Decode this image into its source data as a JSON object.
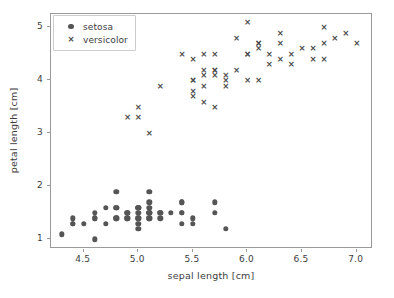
{
  "chart_data": {
    "type": "scatter",
    "title": "",
    "xlabel": "sepal length [cm]",
    "ylabel": "petal length [cm]",
    "xlim": [
      4.2,
      7.15
    ],
    "ylim": [
      0.82,
      5.25
    ],
    "xticks": [
      "4.5",
      "5.0",
      "5.5",
      "6.0",
      "6.5",
      "7.0"
    ],
    "xtick_values": [
      4.5,
      5.0,
      5.5,
      6.0,
      6.5,
      7.0
    ],
    "yticks": [
      "1",
      "2",
      "3",
      "4",
      "5"
    ],
    "ytick_values": [
      1,
      2,
      3,
      4,
      5
    ],
    "grid": false,
    "legend_position": "upper left",
    "marker_color": "#555555",
    "series": [
      {
        "name": "setosa",
        "marker": "circle",
        "color": "#555555",
        "points": [
          [
            5.1,
            1.4
          ],
          [
            4.9,
            1.4
          ],
          [
            4.7,
            1.3
          ],
          [
            4.6,
            1.5
          ],
          [
            5.0,
            1.4
          ],
          [
            5.4,
            1.7
          ],
          [
            4.6,
            1.4
          ],
          [
            5.0,
            1.5
          ],
          [
            4.4,
            1.4
          ],
          [
            4.9,
            1.5
          ],
          [
            5.4,
            1.5
          ],
          [
            4.8,
            1.6
          ],
          [
            4.8,
            1.4
          ],
          [
            4.3,
            1.1
          ],
          [
            5.8,
            1.2
          ],
          [
            5.7,
            1.5
          ],
          [
            5.4,
            1.3
          ],
          [
            5.1,
            1.4
          ],
          [
            5.7,
            1.7
          ],
          [
            5.1,
            1.5
          ],
          [
            5.4,
            1.7
          ],
          [
            5.1,
            1.5
          ],
          [
            4.6,
            1.0
          ],
          [
            5.1,
            1.7
          ],
          [
            4.8,
            1.9
          ],
          [
            5.0,
            1.6
          ],
          [
            5.0,
            1.6
          ],
          [
            5.2,
            1.5
          ],
          [
            5.2,
            1.4
          ],
          [
            4.7,
            1.6
          ],
          [
            4.8,
            1.6
          ],
          [
            5.4,
            1.5
          ],
          [
            5.2,
            1.5
          ],
          [
            5.5,
            1.4
          ],
          [
            4.9,
            1.5
          ],
          [
            5.0,
            1.2
          ],
          [
            5.5,
            1.3
          ],
          [
            4.9,
            1.4
          ],
          [
            4.4,
            1.3
          ],
          [
            5.1,
            1.5
          ],
          [
            5.0,
            1.3
          ],
          [
            4.5,
            1.3
          ],
          [
            4.4,
            1.3
          ],
          [
            5.0,
            1.6
          ],
          [
            5.1,
            1.9
          ],
          [
            4.8,
            1.4
          ],
          [
            5.1,
            1.6
          ],
          [
            4.6,
            1.4
          ],
          [
            5.3,
            1.5
          ],
          [
            5.0,
            1.4
          ]
        ]
      },
      {
        "name": "versicolor",
        "marker": "x",
        "color": "#4a4a4a",
        "points": [
          [
            7.0,
            4.7
          ],
          [
            6.4,
            4.5
          ],
          [
            6.9,
            4.9
          ],
          [
            5.5,
            4.0
          ],
          [
            6.5,
            4.6
          ],
          [
            5.7,
            4.5
          ],
          [
            6.3,
            4.7
          ],
          [
            4.9,
            3.3
          ],
          [
            6.6,
            4.6
          ],
          [
            5.2,
            3.9
          ],
          [
            5.0,
            3.5
          ],
          [
            5.9,
            4.2
          ],
          [
            6.0,
            4.0
          ],
          [
            6.1,
            4.7
          ],
          [
            5.6,
            3.6
          ],
          [
            6.7,
            4.4
          ],
          [
            5.6,
            4.5
          ],
          [
            5.8,
            4.1
          ],
          [
            6.2,
            4.5
          ],
          [
            5.6,
            3.9
          ],
          [
            5.9,
            4.8
          ],
          [
            6.1,
            4.0
          ],
          [
            6.3,
            4.9
          ],
          [
            6.1,
            4.7
          ],
          [
            6.4,
            4.3
          ],
          [
            6.6,
            4.4
          ],
          [
            6.8,
            4.8
          ],
          [
            6.7,
            5.0
          ],
          [
            6.0,
            4.5
          ],
          [
            5.7,
            3.5
          ],
          [
            5.5,
            3.8
          ],
          [
            5.5,
            3.7
          ],
          [
            5.8,
            3.9
          ],
          [
            6.0,
            5.1
          ],
          [
            5.4,
            4.5
          ],
          [
            6.0,
            4.5
          ],
          [
            6.7,
            4.7
          ],
          [
            6.3,
            4.4
          ],
          [
            5.6,
            4.1
          ],
          [
            5.5,
            4.0
          ],
          [
            5.5,
            4.4
          ],
          [
            6.1,
            4.6
          ],
          [
            5.8,
            4.0
          ],
          [
            5.0,
            3.3
          ],
          [
            5.6,
            4.2
          ],
          [
            5.7,
            4.2
          ],
          [
            5.7,
            4.2
          ],
          [
            6.2,
            4.3
          ],
          [
            5.1,
            3.0
          ],
          [
            5.7,
            4.1
          ]
        ]
      }
    ]
  },
  "legend": {
    "entries": [
      {
        "label": "setosa",
        "marker": "circle-marker"
      },
      {
        "label": "versicolor",
        "marker": "x-marker"
      }
    ]
  }
}
